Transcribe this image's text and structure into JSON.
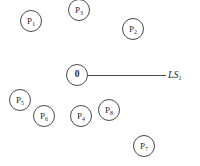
{
  "diagram": {
    "title": "",
    "background_color": "#ffffff",
    "node_stroke_color": "#4a4a4a",
    "text_color": "#2b2b2b",
    "origin": {
      "name": "origin-node",
      "label_main": "0",
      "label_sub": "",
      "x": 66,
      "y": 64,
      "size": 22
    },
    "edge": {
      "name": "ls1-edge",
      "from": "0",
      "to": "LS1",
      "x": 88,
      "y": 75,
      "length": 78,
      "label_main": "LS",
      "label_sub": "1",
      "label_x": 168,
      "label_y": 69
    },
    "nodes": [
      {
        "name": "node-p1",
        "label_main": "P",
        "label_sub": "1",
        "x": 20,
        "y": 10,
        "size": 22
      },
      {
        "name": "node-p3",
        "label_main": "P",
        "label_sub": "3",
        "x": 68,
        "y": -1,
        "size": 22
      },
      {
        "name": "node-p2",
        "label_main": "P",
        "label_sub": "2",
        "x": 122,
        "y": 18,
        "size": 22
      },
      {
        "name": "node-p5",
        "label_main": "P",
        "label_sub": "5",
        "x": 9,
        "y": 89,
        "size": 22
      },
      {
        "name": "node-p6",
        "label_main": "P",
        "label_sub": "6",
        "x": 33,
        "y": 105,
        "size": 22
      },
      {
        "name": "node-p4",
        "label_main": "P",
        "label_sub": "4",
        "x": 70,
        "y": 105,
        "size": 22
      },
      {
        "name": "node-p8",
        "label_main": "P",
        "label_sub": "8",
        "x": 98,
        "y": 99,
        "size": 22
      },
      {
        "name": "node-p7",
        "label_main": "P",
        "label_sub": "7",
        "x": 133,
        "y": 135,
        "size": 22
      }
    ]
  }
}
